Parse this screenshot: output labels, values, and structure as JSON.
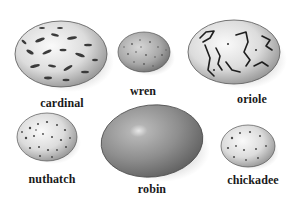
{
  "figure": {
    "eggs": [
      {
        "id": "cardinal",
        "label": "cardinal",
        "pattern": "dark blotches on pale shell",
        "cx": 61,
        "cy": 54,
        "rx": 46,
        "ry": 33,
        "label_x": 62,
        "label_y": 96
      },
      {
        "id": "wren",
        "label": "wren",
        "pattern": "fine speckles, mottled gray",
        "cx": 144,
        "cy": 52,
        "rx": 26,
        "ry": 20,
        "label_x": 143,
        "label_y": 84
      },
      {
        "id": "oriole",
        "label": "oriole",
        "pattern": "dark scrawled lines on pale shell",
        "cx": 234,
        "cy": 52,
        "rx": 46,
        "ry": 32,
        "label_x": 252,
        "label_y": 92
      },
      {
        "id": "nuthatch",
        "label": "nuthatch",
        "pattern": "dense small speckles",
        "cx": 47,
        "cy": 137,
        "rx": 30,
        "ry": 24,
        "label_x": 52,
        "label_y": 172
      },
      {
        "id": "robin",
        "label": "robin",
        "pattern": "plain smooth, uniform tone",
        "cx": 152,
        "cy": 141,
        "rx": 51,
        "ry": 36,
        "label_x": 152,
        "label_y": 182
      },
      {
        "id": "chickadee",
        "label": "chickadee",
        "pattern": "sparse reddish-brown spots",
        "cx": 248,
        "cy": 146,
        "rx": 27,
        "ry": 21,
        "label_x": 253,
        "label_y": 173
      }
    ]
  },
  "colors": {
    "background": "#ffffff",
    "label_text": "#1a1a1a",
    "robin_shell": "#8a8a8a",
    "speckle": "#3a3a3a",
    "shadow": "#6a6a6a"
  }
}
